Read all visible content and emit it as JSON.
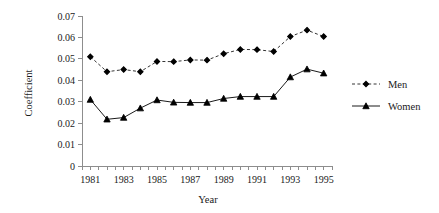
{
  "chart_data": {
    "type": "line",
    "title": "",
    "xlabel": "Year",
    "ylabel": "Coefficient",
    "x": [
      1981,
      1982,
      1983,
      1984,
      1985,
      1986,
      1987,
      1988,
      1989,
      1990,
      1991,
      1992,
      1993,
      1994,
      1995
    ],
    "xtick_labels": [
      "1981",
      "1983",
      "1985",
      "1987",
      "1989",
      "1991",
      "1993",
      "1995"
    ],
    "xtick_values": [
      1981,
      1983,
      1985,
      1987,
      1989,
      1991,
      1993,
      1995
    ],
    "xlim": [
      1980.5,
      1995.5
    ],
    "ytick_labels": [
      "0",
      "0.01",
      "0.02",
      "0.03",
      "0.04",
      "0.05",
      "0.06",
      "0.07"
    ],
    "ytick_values": [
      0,
      0.01,
      0.02,
      0.03,
      0.04,
      0.05,
      0.06,
      0.07
    ],
    "ylim": [
      0,
      0.07
    ],
    "grid": false,
    "legend_position": "right",
    "series": [
      {
        "name": "Men",
        "marker": "diamond",
        "line_style": "dashed",
        "color": "#000000",
        "values": [
          0.051,
          0.044,
          0.045,
          0.044,
          0.0488,
          0.0487,
          0.0495,
          0.0494,
          0.0524,
          0.0544,
          0.0543,
          0.0534,
          0.0604,
          0.0634,
          0.0604
        ]
      },
      {
        "name": "Women",
        "marker": "triangle",
        "line_style": "solid",
        "color": "#000000",
        "values": [
          0.031,
          0.0218,
          0.0226,
          0.027,
          0.0308,
          0.0297,
          0.0296,
          0.0296,
          0.0315,
          0.0324,
          0.0324,
          0.0324,
          0.0415,
          0.0452,
          0.0433
        ]
      }
    ]
  },
  "legend": {
    "entries": [
      {
        "label": "Men"
      },
      {
        "label": "Women"
      }
    ]
  }
}
